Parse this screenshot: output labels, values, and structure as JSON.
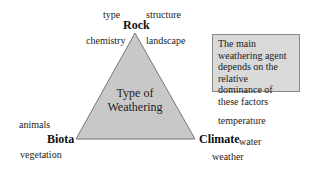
{
  "diagram": {
    "center": {
      "line1": "Type of",
      "line2": "Weathering"
    },
    "vertices": {
      "top": {
        "label": "Rock",
        "factors": [
          "type",
          "structure",
          "chemistry",
          "landscape"
        ]
      },
      "left": {
        "label": "Biota",
        "factors": [
          "animals",
          "vegetation"
        ]
      },
      "right": {
        "label": "Climate",
        "factors": [
          "temperature",
          "water",
          "weather"
        ]
      }
    },
    "note": "The main weathering agent depends on the relative dominance of these factors",
    "colors": {
      "triangle_fill": "#c8c8c8",
      "triangle_stroke": "#777777",
      "note_fill": "#d9d9d9"
    }
  }
}
